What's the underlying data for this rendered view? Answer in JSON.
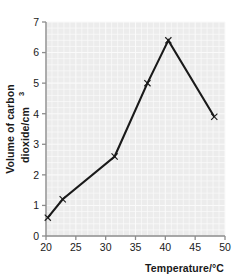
{
  "chart_data": {
    "type": "line",
    "title": "",
    "xlabel": "Temperature/°C",
    "ylabel": "Volume of carbon dioxide/cm³",
    "ylabel_line1": "Volume of carbon",
    "ylabel_line2": "dioxide/cm",
    "ylabel_line2_sup": "3",
    "xlim": [
      20,
      50
    ],
    "ylim": [
      0,
      7
    ],
    "xticks": [
      20,
      25,
      30,
      35,
      40,
      45,
      50
    ],
    "yticks": [
      0,
      1,
      2,
      3,
      4,
      5,
      6,
      7
    ],
    "xtick_labels": [
      "20",
      "25",
      "30",
      "35",
      "40",
      "45",
      "50"
    ],
    "ytick_labels": [
      "0",
      "1",
      "2",
      "3",
      "4",
      "5",
      "6",
      "7"
    ],
    "grid": true,
    "legend": false,
    "marker": "x",
    "series": [
      {
        "name": "Volume of carbon dioxide",
        "x": [
          20.3,
          22.8,
          31.5,
          37.0,
          40.5,
          48.2
        ],
        "y": [
          0.6,
          1.2,
          2.6,
          5.0,
          6.4,
          3.9
        ]
      }
    ],
    "colors": {
      "line": "#1a1a1a",
      "plot_background": "#ececec",
      "gridline": "#fafafa",
      "axis": "#8c8c8c",
      "text": "#1a1a1a"
    }
  },
  "axes": {
    "x_axis_name": "temperature-axis",
    "y_axis_name": "volume-axis"
  }
}
